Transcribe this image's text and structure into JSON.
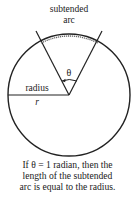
{
  "diagram": {
    "labels": {
      "subtended_line1": "subtended",
      "subtended_line2": "arc",
      "theta": "θ",
      "radius": "radius",
      "r": "r"
    },
    "caption": {
      "line1": "If θ = 1 radian, then the",
      "line2": "length of the subtended",
      "line3": "arc is equal to the radius."
    },
    "colors": {
      "stroke": "#222222",
      "arc": "#555555",
      "background": "#ffffff"
    }
  }
}
